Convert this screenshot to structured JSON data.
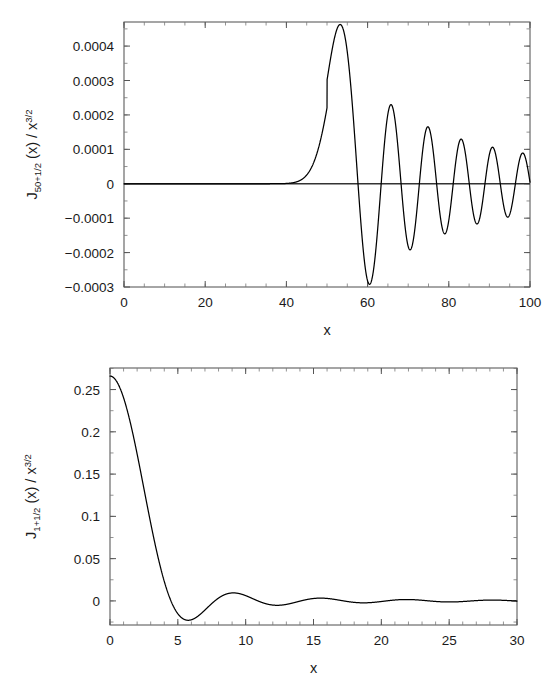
{
  "page": {
    "background_color": "#ffffff",
    "curve_color": "#000000",
    "axis_color": "#4d4d4d",
    "text_color": "#1a1a1a"
  },
  "chart_data": [
    {
      "id": "top",
      "type": "line",
      "title": "",
      "xlabel": "x",
      "ylabel": "J_50+1/2 (x) / x^3/2",
      "ylabel_parts": {
        "base": "J",
        "subscript": "50+1/2",
        "arg": " (x) / x",
        "superscript": "3/2"
      },
      "xlim": [
        0,
        100
      ],
      "ylim": [
        -0.0003,
        0.00047
      ],
      "xticks": [
        0,
        20,
        40,
        60,
        80,
        100
      ],
      "xticklabels": [
        "0",
        "20",
        "40",
        "60",
        "80",
        "100"
      ],
      "yticks": [
        0.0004,
        0.0003,
        0.0002,
        0.0001,
        0,
        -0.0001,
        -0.0002,
        -0.0003
      ],
      "yticklabels": [
        "0.0004",
        "0.0003",
        "0.0002",
        "0.0001",
        "0",
        "−0.0001",
        "−0.0002",
        "−0.0003"
      ],
      "minor_ticks": true,
      "grid": false,
      "legend": null,
      "order": 50.5,
      "series": [
        {
          "name": "J_50.5(x) / x^(3/2)",
          "description": "Spherical-type Bessel function of order 50+1/2 divided by x^(3/2); negligible until x~40, rises to a global maximum near x=53, then damped oscillation to x=100",
          "key_points": [
            {
              "x": 0,
              "y": 0.0
            },
            {
              "x": 20,
              "y": 0.0
            },
            {
              "x": 35,
              "y": 0.0
            },
            {
              "x": 40,
              "y": 6e-07
            },
            {
              "x": 45,
              "y": 2.9e-05
            },
            {
              "x": 48,
              "y": 9.9e-05
            },
            {
              "x": 50,
              "y": 0.000205
            },
            {
              "x": 52,
              "y": 0.000375
            },
            {
              "x": 53.2,
              "y": 0.000465
            },
            {
              "x": 55,
              "y": 0.000405
            },
            {
              "x": 57,
              "y": 0.00015
            },
            {
              "x": 58.5,
              "y": -0.0001
            },
            {
              "x": 60.5,
              "y": -0.000288
            },
            {
              "x": 62.5,
              "y": -0.00019
            },
            {
              "x": 64,
              "y": 6e-05
            },
            {
              "x": 65.5,
              "y": 0.000235
            },
            {
              "x": 67,
              "y": 0.00016
            },
            {
              "x": 69,
              "y": -9e-05
            },
            {
              "x": 70.5,
              "y": -0.000188
            },
            {
              "x": 72.5,
              "y": -9e-05
            },
            {
              "x": 74.5,
              "y": 0.00017
            },
            {
              "x": 76,
              "y": 0.0001
            },
            {
              "x": 78.5,
              "y": -0.000144
            },
            {
              "x": 80,
              "y": -0.0001
            },
            {
              "x": 82.8,
              "y": 0.000135
            },
            {
              "x": 84.5,
              "y": 4e-05
            },
            {
              "x": 86.8,
              "y": -0.000113
            },
            {
              "x": 89,
              "y": 2e-05
            },
            {
              "x": 90.8,
              "y": 0.00011
            },
            {
              "x": 93,
              "y": -3e-05
            },
            {
              "x": 95,
              "y": -9.5e-05
            },
            {
              "x": 97,
              "y": 4e-05
            },
            {
              "x": 98.5,
              "y": 9.7e-05
            },
            {
              "x": 100,
              "y": 5e-06
            }
          ]
        }
      ]
    },
    {
      "id": "bottom",
      "type": "line",
      "title": "",
      "xlabel": "x",
      "ylabel": "J_1+1/2 (x) / x^3/2",
      "ylabel_parts": {
        "base": "J",
        "subscript": "1+1/2",
        "arg": " (x) / x",
        "superscript": "3/2"
      },
      "xlim": [
        0,
        30
      ],
      "ylim": [
        -0.0285,
        0.2755
      ],
      "xticks": [
        0,
        5,
        10,
        15,
        20,
        25,
        30
      ],
      "xticklabels": [
        "0",
        "5",
        "10",
        "15",
        "20",
        "25",
        "30"
      ],
      "yticks": [
        0.25,
        0.2,
        0.15,
        0.1,
        0.05,
        0
      ],
      "yticklabels": [
        "0.25",
        "0.2",
        "0.15",
        "0.1",
        "0.05",
        "0"
      ],
      "minor_ticks": true,
      "grid": false,
      "legend": null,
      "order": 1.5,
      "series": [
        {
          "name": "J_1.5(x) / x^(3/2)",
          "description": "Spherical-type Bessel function of order 1+1/2 divided by x^(3/2); starts at ~0.266 at x=0, decreases monotonically, crosses zero near x=4.5, minimum ~-0.024 near x=5.8, then small damped oscillations approaching zero",
          "key_points": [
            {
              "x": 0,
              "y": 0.2659
            },
            {
              "x": 0.5,
              "y": 0.264
            },
            {
              "x": 1,
              "y": 0.2554
            },
            {
              "x": 1.5,
              "y": 0.242
            },
            {
              "x": 2,
              "y": 0.2232
            },
            {
              "x": 2.5,
              "y": 0.1996
            },
            {
              "x": 3,
              "y": 0.1722
            },
            {
              "x": 3.5,
              "y": 0.142
            },
            {
              "x": 4,
              "y": 0.1104
            },
            {
              "x": 4.5,
              "y": 0.0786
            },
            {
              "x": 5,
              "y": 0.048
            },
            {
              "x": 5.5,
              "y": 0.0198
            },
            {
              "x": 5.9,
              "y": -0.005
            },
            {
              "x": 6.5,
              "y": -0.02
            },
            {
              "x": 7.0,
              "y": -0.0236
            },
            {
              "x": 7.5,
              "y": -0.0215
            },
            {
              "x": 8,
              "y": -0.0155
            },
            {
              "x": 9,
              "y": 0.002
            },
            {
              "x": 10,
              "y": 0.0105
            },
            {
              "x": 10.5,
              "y": 0.0118
            },
            {
              "x": 11,
              "y": 0.0112
            },
            {
              "x": 12,
              "y": 0.0056
            },
            {
              "x": 13,
              "y": -0.0012
            },
            {
              "x": 13.8,
              "y": -0.004
            },
            {
              "x": 14.5,
              "y": -0.0036
            },
            {
              "x": 15.5,
              "y": 0.0003
            },
            {
              "x": 16.8,
              "y": 0.0048
            },
            {
              "x": 17.5,
              "y": 0.005
            },
            {
              "x": 18.5,
              "y": 0.0033
            },
            {
              "x": 19.8,
              "y": -0.0002
            },
            {
              "x": 20.8,
              "y": -0.0018
            },
            {
              "x": 21.8,
              "y": -0.0016
            },
            {
              "x": 23,
              "y": 0.0006
            },
            {
              "x": 24,
              "y": 0.0026
            },
            {
              "x": 25,
              "y": 0.0028
            },
            {
              "x": 26,
              "y": 0.0015
            },
            {
              "x": 27,
              "y": 0.0
            },
            {
              "x": 28,
              "y": -0.0008
            },
            {
              "x": 29,
              "y": -0.0004
            },
            {
              "x": 30,
              "y": 0.0008
            }
          ]
        }
      ]
    }
  ]
}
